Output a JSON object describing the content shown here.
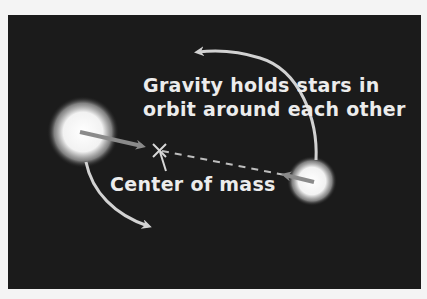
{
  "diagram": {
    "caption_line1": "Gravity holds stars in",
    "caption_line2": "orbit around each other",
    "center_label": "Center of mass",
    "colors": {
      "background": "#1b1b1b",
      "border": "#f4f4f4",
      "text": "#ececec",
      "arrow": "#cfcfcf",
      "star": "#ffffff"
    },
    "elements": {
      "large_star": "star",
      "small_star": "star",
      "center_marker": "x-icon",
      "orbit_arrows": 2,
      "gravity_arrows": 2
    }
  }
}
